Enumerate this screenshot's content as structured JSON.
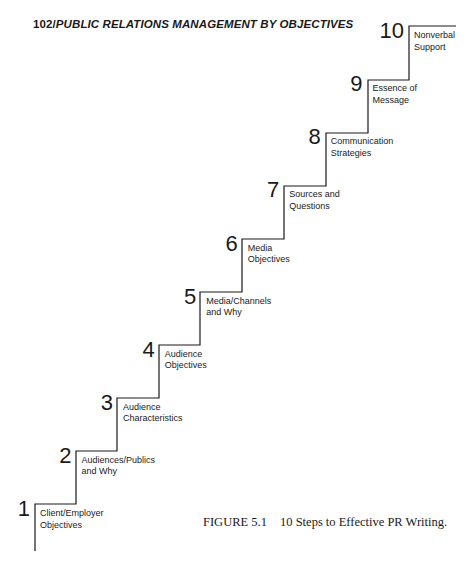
{
  "header": {
    "page_number": "102/",
    "running_title": "PUBLIC RELATIONS MANAGEMENT BY OBJECTIVES"
  },
  "figure": {
    "caption_label": "FIGURE 5.1",
    "caption_text": "10 Steps to Effective PR Writing.",
    "steps": [
      {
        "number": "1",
        "label": "Client/Employer\nObjectives"
      },
      {
        "number": "2",
        "label": "Audiences/Publics\nand Why"
      },
      {
        "number": "3",
        "label": "Audience\nCharacteristics"
      },
      {
        "number": "4",
        "label": "Audience\nObjectives"
      },
      {
        "number": "5",
        "label": "Media/Channels\nand Why"
      },
      {
        "number": "6",
        "label": "Media\nObjectives"
      },
      {
        "number": "7",
        "label": "Sources and\nQuestions"
      },
      {
        "number": "8",
        "label": "Communication\nStrategies"
      },
      {
        "number": "9",
        "label": "Essence of\nMessage"
      },
      {
        "number": "10",
        "label": "Nonverbal\nSupport"
      }
    ]
  }
}
